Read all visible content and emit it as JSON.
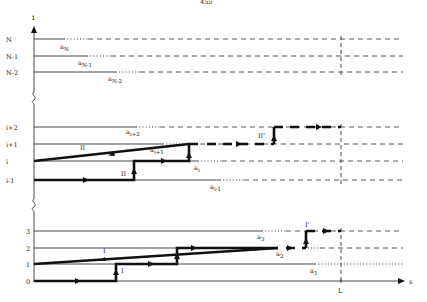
{
  "page_header": "455",
  "axes": {
    "y_label": "i",
    "x_label": "s",
    "x_marker": "L"
  },
  "levels": {
    "top": [
      "N",
      "N-1",
      "N-2"
    ],
    "middle": [
      "i+2",
      "i+1",
      "i",
      "i-1"
    ],
    "bottom": [
      "3",
      "2",
      "1",
      "0"
    ]
  },
  "points": {
    "aN": {
      "base": "a",
      "sub": "N"
    },
    "aN1": {
      "base": "a",
      "sub": "N-1"
    },
    "aN2": {
      "base": "a",
      "sub": "N-2"
    },
    "ai2": {
      "base": "a",
      "sub": "i+2"
    },
    "ai1": {
      "base": "a",
      "sub": "i+1"
    },
    "ai": {
      "base": "a",
      "sub": "i"
    },
    "aim1": {
      "base": "a",
      "sub": "i-1"
    },
    "a3": {
      "base": "a",
      "sub": "3"
    },
    "a2": {
      "base": "a",
      "sub": "2"
    },
    "a1": {
      "base": "a",
      "sub": "1"
    }
  },
  "paths": {
    "II": "II",
    "II_lower": "II",
    "II_prime": "II'",
    "I": "I",
    "I_lower": "I",
    "I_prime": "I'"
  }
}
